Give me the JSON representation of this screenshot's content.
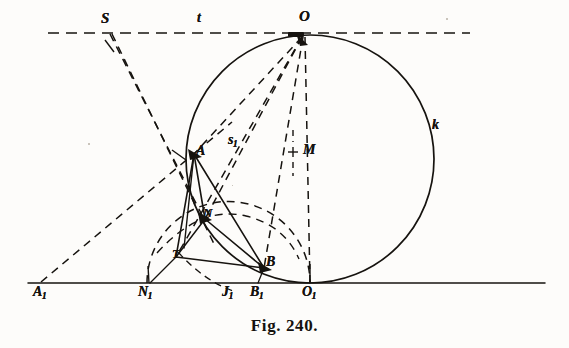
{
  "figure": {
    "caption": "Fig. 240.",
    "ink_color": "#16130f",
    "paper_color": "#fdfcfa"
  },
  "labels": {
    "S": "S",
    "t": "t",
    "O": "O",
    "k": "k",
    "M": "M",
    "s": "s",
    "s1_base": "s",
    "s1_sub": "1",
    "A": "A",
    "N": "N",
    "T": "T",
    "B": "B",
    "A1_base": "A",
    "A1_sub": "1",
    "N1_base": "N",
    "N1_sub": "1",
    "J1_base": "J",
    "J1_sub": "1",
    "B1_base": "B",
    "B1_sub": "1",
    "O1_base": "O",
    "O1_sub": "1"
  },
  "geometry": {
    "description": "Tangent-circle construction: circle k tangent to line t at O and to the base line at O1",
    "baseline_y": 283,
    "tangent_line_t_y": 33,
    "circle_k": {
      "cx": 310,
      "cy": 159,
      "r": 124
    },
    "semicircle_dashed": {
      "cx": 227,
      "cy": 283,
      "r": 80
    },
    "points": {
      "S": {
        "x": 110,
        "y": 33
      },
      "O": {
        "x": 302,
        "y": 36
      },
      "M": {
        "x": 296,
        "y": 152
      },
      "A": {
        "x": 194,
        "y": 154
      },
      "N": {
        "x": 205,
        "y": 219
      },
      "T": {
        "x": 176,
        "y": 257
      },
      "B": {
        "x": 264,
        "y": 268
      },
      "A1": {
        "x": 42,
        "y": 283
      },
      "N1": {
        "x": 148,
        "y": 283
      },
      "J1": {
        "x": 228,
        "y": 283
      },
      "B1": {
        "x": 258,
        "y": 283
      },
      "O1": {
        "x": 310,
        "y": 283
      }
    }
  }
}
